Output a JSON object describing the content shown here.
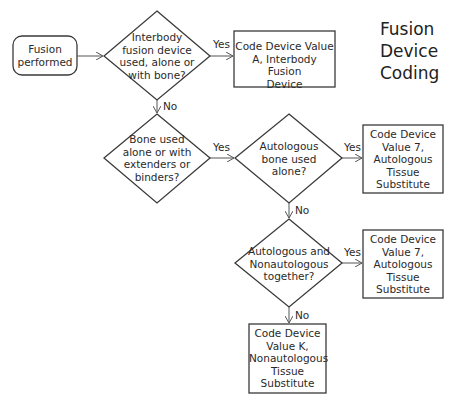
{
  "title": "Fusion\nDevice\nCoding",
  "nodes": {
    "start": "Fusion\nperformed",
    "q1": "Interbody\nfusion device\nused, alone or\nwith bone?",
    "resultA": "Code Device Value\nA, Interbody Fusion\nDevice",
    "q2": "Bone used\nalone or with\nextenders or\nbinders?",
    "q3": "Autologous\nbone used\nalone?",
    "result7a": "Code Device\nValue 7,\nAutologous\nTissue\nSubstitute",
    "q4": "Autologous and\nNonautologous\ntogether?",
    "result7b": "Code Device\nValue 7,\nAutologous\nTissue\nSubstitute",
    "resultK": "Code Device\nValue K,\nNonautologous\nTissue\nSubstitute"
  },
  "edges": {
    "q1_yes": "Yes",
    "q1_no": "No",
    "q2_yes": "Yes",
    "q3_yes": "Yes",
    "q3_no": "No",
    "q4_yes": "Yes",
    "q4_no": "No"
  },
  "colors": {
    "stroke": "#3a3a3a",
    "text": "#2a2a2a",
    "background": "#ffffff"
  }
}
